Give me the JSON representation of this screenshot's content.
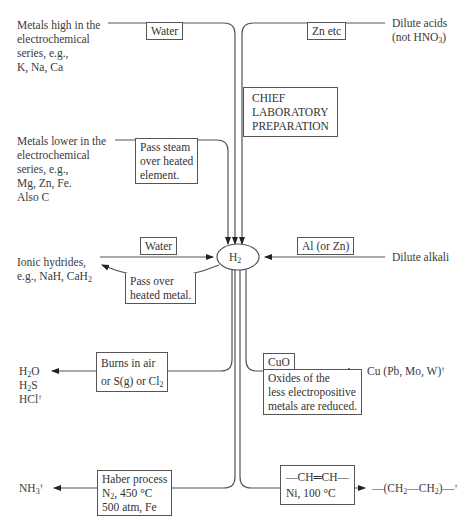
{
  "diagram": {
    "center": {
      "label": "H",
      "sub": "2"
    },
    "sources": {
      "metals_high": {
        "lines": [
          "Metals high in the",
          "electrochemical",
          "series, e.g.,",
          "K, Na, Ca"
        ],
        "reagent": "Water"
      },
      "dilute_acids": {
        "lines": [
          "Dilute acids",
          "(not HNO",
          "3",
          ")"
        ],
        "reagent": "Zn etc",
        "note": [
          "CHIEF",
          "LABORATORY",
          "PREPARATION"
        ]
      },
      "metals_lower": {
        "lines": [
          "Metals lower in the",
          "electrochemical",
          "series, e.g.,",
          "Mg, Zn, Fe.",
          "Also C"
        ],
        "reagent": [
          "Pass steam",
          "over heated",
          "element."
        ]
      },
      "ionic_hydrides": {
        "lines": [
          "Ionic hydrides,",
          "e.g., NaH, CaH",
          "2"
        ],
        "reagent": "Water",
        "reverse": [
          "Pass over",
          "heated metal."
        ]
      },
      "dilute_alkali": {
        "label": "Dilute alkali",
        "reagent": "Al (or Zn)"
      }
    },
    "products": {
      "burns": {
        "lines": [
          "H",
          "2",
          "O",
          "H",
          "2",
          "S",
          "HCl",
          "†"
        ],
        "condition": [
          "Burns in air",
          "or S(g) or Cl",
          "2"
        ]
      },
      "reduction": {
        "label": "Cu (Pb, Mo, W)",
        "dagger": "†",
        "reagent": "CuO",
        "note": [
          "Oxides of the",
          "less electropositive",
          "metals are reduced."
        ]
      },
      "haber": {
        "label": "NH",
        "sub": "3",
        "dagger": "†",
        "condition": [
          "Haber process",
          "N",
          "2",
          ", 450 °C",
          "500 atm, Fe"
        ]
      },
      "hydrogenation": {
        "label_a": "—(CH",
        "sub1": "2",
        "label_b": "—CH",
        "sub2": "2",
        "label_c": ")—",
        "dagger": "†",
        "condition": [
          "—CH═CH—",
          "Ni, 100 °C"
        ]
      }
    }
  }
}
